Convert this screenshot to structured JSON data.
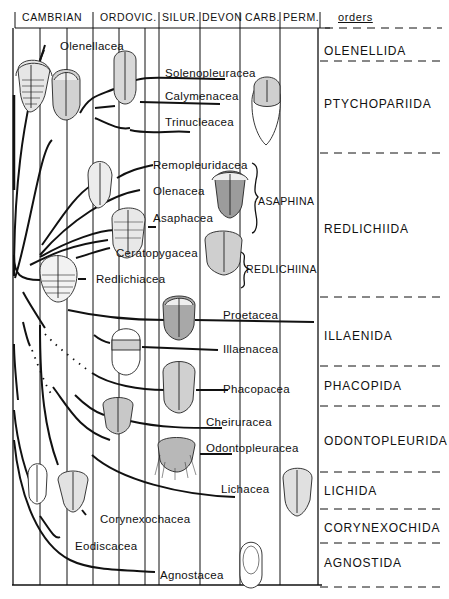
{
  "header": {
    "periods": [
      {
        "label": "CAMBRIAN",
        "x": 22
      },
      {
        "label": "ORDOVIC.",
        "x": 100
      },
      {
        "label": "SILUR.",
        "x": 163
      },
      {
        "label": "DEVON",
        "x": 202
      },
      {
        "label": "CARB.",
        "x": 246
      },
      {
        "label": "PERM.",
        "x": 283
      }
    ],
    "orders_label": "orders"
  },
  "superfamilies": [
    {
      "label": "Olenellacea",
      "x": 60,
      "y": 41
    },
    {
      "label": "Solenopleuracea",
      "x": 165,
      "y": 68
    },
    {
      "label": "Calymenacea",
      "x": 165,
      "y": 91
    },
    {
      "label": "Trinucleacea",
      "x": 165,
      "y": 117
    },
    {
      "label": "Remopleuridacea",
      "x": 153,
      "y": 160
    },
    {
      "label": "Olenacea",
      "x": 153,
      "y": 186
    },
    {
      "label": "Asaphacea",
      "x": 153,
      "y": 213
    },
    {
      "label": "Ceratopygacea",
      "x": 116,
      "y": 248
    },
    {
      "label": "Redlichiacea",
      "x": 96,
      "y": 274
    },
    {
      "label": "Proetacea",
      "x": 223,
      "y": 310
    },
    {
      "label": "Illaenacea",
      "x": 223,
      "y": 344
    },
    {
      "label": "Phacopacea",
      "x": 223,
      "y": 377
    },
    {
      "label": "Cheiruracea",
      "x": 206,
      "y": 417
    },
    {
      "label": "Odontopleuracea",
      "x": 206,
      "y": 443
    },
    {
      "label": "Lichacea",
      "x": 221,
      "y": 484
    },
    {
      "label": "Corynexochacea",
      "x": 100,
      "y": 514
    },
    {
      "label": "Eodiscacea",
      "x": 75,
      "y": 541
    },
    {
      "label": "Agnostacea",
      "x": 160,
      "y": 570
    }
  ],
  "suborders": [
    {
      "label": "ASAPHINA",
      "x": 258,
      "y": 196
    },
    {
      "label": "REDLICHIINA",
      "x": 246,
      "y": 262
    }
  ],
  "orders": [
    {
      "label": "OLENELLIDA",
      "y": 45
    },
    {
      "label": "PTYCHOPARIIDA",
      "y": 98
    },
    {
      "label": "REDLICHIIDA",
      "y": 223
    },
    {
      "label": "ILLAENIDA",
      "y": 330
    },
    {
      "label": "PHACOPIDA",
      "y": 380
    },
    {
      "label": "ODONTOPLEURIDA",
      "y": 435
    },
    {
      "label": "LICHIDA",
      "y": 485
    },
    {
      "label": "CORYNEXOCHIDA",
      "y": 522
    },
    {
      "label": "AGNOSTIDA",
      "y": 557
    }
  ],
  "colors": {
    "ink": "#111111",
    "background": "#ffffff"
  }
}
